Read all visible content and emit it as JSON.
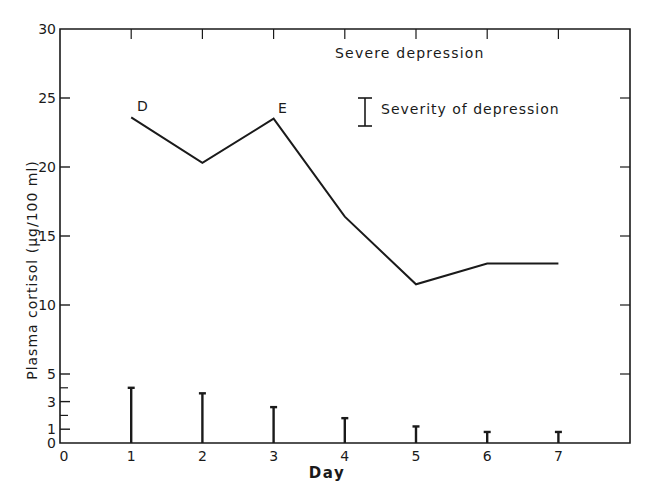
{
  "chart_data": {
    "type": "line",
    "title": "Severe depression",
    "xlabel": "Day",
    "ylabel": "Plasma cortisol (μg/100 ml)",
    "xlim": [
      0,
      8
    ],
    "ylim": [
      0,
      30
    ],
    "x_ticks": [
      "0",
      "1",
      "2",
      "3",
      "4",
      "5",
      "6",
      "7"
    ],
    "y_ticks": [
      "0",
      "1",
      "3",
      "5",
      "10",
      "15",
      "20",
      "25",
      "30"
    ],
    "y_tick_values": [
      0,
      1,
      3,
      5,
      10,
      15,
      20,
      25,
      30
    ],
    "y_minor_ticks": [
      2,
      4
    ],
    "grid": false,
    "x": [
      1,
      2,
      3,
      4,
      5,
      6,
      7
    ],
    "series": [
      {
        "name": "Plasma cortisol",
        "type": "line",
        "values": [
          23.6,
          20.3,
          23.5,
          16.4,
          11.5,
          13.0,
          13.0
        ]
      },
      {
        "name": "Severity of depression",
        "type": "bar",
        "values": [
          4.0,
          3.6,
          2.6,
          1.8,
          1.2,
          0.8,
          0.8
        ]
      }
    ],
    "annotations": [
      {
        "text": "D",
        "x": 1,
        "y": 23.6
      },
      {
        "text": "E",
        "x": 3,
        "y": 23.5
      }
    ],
    "legend": {
      "position": "top-right",
      "entries": [
        "Severity of depression"
      ]
    }
  },
  "labels": {
    "title": "Severe depression",
    "legend_severity": "Severity of depression",
    "xlabel": "Day",
    "ylabel": "Plasma cortisol (μg/100 ml)",
    "marker_d": "D",
    "marker_e": "E"
  }
}
